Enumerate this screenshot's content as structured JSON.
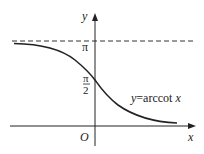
{
  "diagram": {
    "title": "y=arccot x",
    "function_label": "y=arccot x",
    "axes": {
      "x_label": "x",
      "y_label": "y",
      "origin_label": "O"
    },
    "ticks": {
      "pi_label": "π",
      "half_pi_numerator": "π",
      "half_pi_denominator": "2"
    },
    "asymptote": {
      "value": "π",
      "style": "dashed"
    },
    "colors": {
      "stroke": "#222222",
      "background": "#ffffff"
    }
  }
}
